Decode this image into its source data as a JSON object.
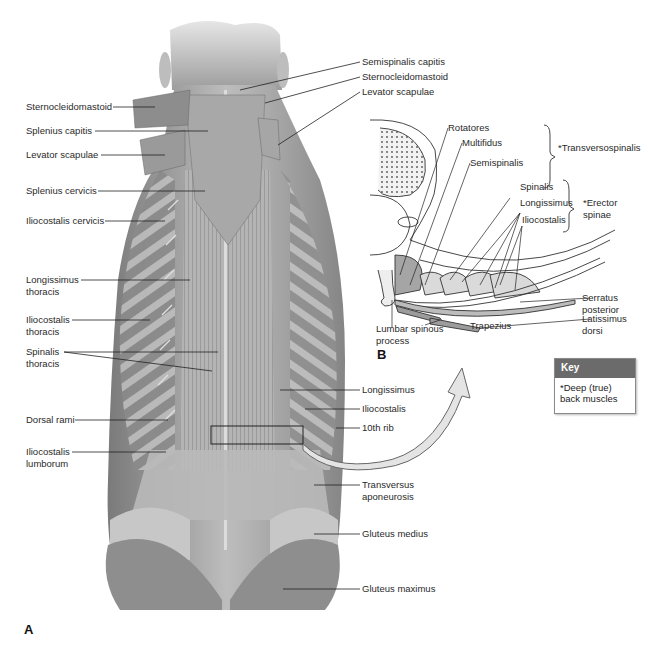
{
  "figure": {
    "panel_a_letter": "A",
    "panel_b_letter": "B",
    "panel_a": {
      "left_labels": [
        {
          "text": "Sternocleidomastoid"
        },
        {
          "text": "Splenius capitis"
        },
        {
          "text": "Levator scapulae"
        },
        {
          "text": "Splenius cervicis"
        },
        {
          "text": "Iliocostalis cervicis"
        },
        {
          "text": "Longissimus thoracis"
        },
        {
          "text": "Iliocostalis thoracis"
        },
        {
          "text": "Spinalis thoracis"
        },
        {
          "text": "Dorsal rami"
        },
        {
          "text": "Iliocostalis lumborum"
        }
      ],
      "right_labels": [
        {
          "text": "Semispinalis capitis"
        },
        {
          "text": "Sternocleidomastoid"
        },
        {
          "text": "Levator scapulae"
        },
        {
          "text": "Longissimus"
        },
        {
          "text": "Iliocostalis"
        },
        {
          "text": "10th rib"
        },
        {
          "text": "Transversus aponeurosis"
        },
        {
          "text": "Gluteus medius"
        },
        {
          "text": "Gluteus maximus"
        }
      ]
    },
    "panel_b": {
      "labels": {
        "rotatores": "Rotatores",
        "multifidus": "Multifidus",
        "semispinalis": "Semispinalis",
        "transversospinalis_group": "*Transversospinalis",
        "spinalis": "Spinalis",
        "longissimus": "Longissimus",
        "iliocostalis": "Iliocostalis",
        "erector_spinae_group": "*Erector spinae",
        "serratus_posterior": "Serratus posterior",
        "latissimus_dorsi": "Latissimus dorsi",
        "trapezius": "Trapezius",
        "lumbar_spinous_process": "Lumbar spinous process"
      }
    },
    "key": {
      "title": "Key",
      "text": "*Deep (true) back muscles"
    },
    "colors": {
      "muscle_dark": "#5a5a5a",
      "muscle_mid": "#8c8c8c",
      "muscle_light": "#c4c4c4",
      "key_header": "#6b6b6b",
      "leader_line": "#222222",
      "arrow_fill": "#e4e4e4"
    }
  }
}
